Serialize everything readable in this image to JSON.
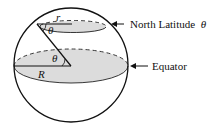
{
  "diagram": {
    "labels": {
      "north_latitude": "North Latitude",
      "theta_symbol": "θ",
      "equator": "Equator",
      "radius": "R",
      "small_radius": "r",
      "angle_top": "θ",
      "angle_center": "θ"
    },
    "colors": {
      "stroke": "#111111",
      "fill": "#d9d9d9"
    }
  }
}
